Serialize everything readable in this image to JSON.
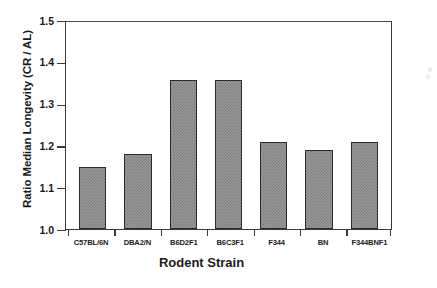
{
  "chart_data": {
    "type": "bar",
    "title": "",
    "xlabel": "Rodent Strain",
    "ylabel": "Ratio Median Longevity (CR / AL)",
    "categories": [
      "C57BL/6N",
      "DBA2/N",
      "B6D2F1",
      "B6C3F1",
      "F344",
      "BN",
      "F344BNF1"
    ],
    "values": [
      1.15,
      1.18,
      1.36,
      1.36,
      1.21,
      1.19,
      1.21
    ],
    "ylim": [
      1.0,
      1.5
    ],
    "ytick_labels": [
      "1.5",
      "1.4",
      "1.3",
      "1.2",
      "1.1",
      "1.0"
    ],
    "ytick_values": [
      1.5,
      1.4,
      1.3,
      1.2,
      1.1,
      1.0
    ],
    "ytick_step": 0.1,
    "grid": false,
    "legend": "none",
    "bar_fill_color": "#9a9a9a",
    "bar_edge_color": "#2b2b2b",
    "axis_color": "#3a3a3a",
    "background_color": "#ffffff"
  }
}
